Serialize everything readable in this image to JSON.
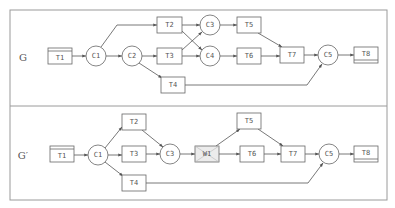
{
  "frame": {
    "left": 10,
    "top": 10,
    "right": 387,
    "divider": 106,
    "bottom": 200
  },
  "colors": {
    "frame": "#9a9a9a",
    "edge": "#555555",
    "node_stroke": "#666666",
    "node_fill": "#ffffff",
    "shaded_fill": "#ececec",
    "text": "#555555"
  },
  "graphs": [
    {
      "id": "G",
      "label": "G",
      "label_pos": [
        23,
        57
      ],
      "nodes": [
        {
          "id": "T1",
          "label": "T1",
          "type": "source",
          "x": 48,
          "y": 48,
          "w": 24,
          "h": 16
        },
        {
          "id": "C1",
          "label": "C1",
          "type": "circle",
          "cx": 96,
          "cy": 56,
          "r": 10
        },
        {
          "id": "C2",
          "label": "C2",
          "type": "circle",
          "cx": 132,
          "cy": 56,
          "r": 10
        },
        {
          "id": "T2",
          "label": "T2",
          "type": "task",
          "x": 157,
          "y": 17,
          "w": 25,
          "h": 16
        },
        {
          "id": "T3",
          "label": "T3",
          "type": "task",
          "x": 157,
          "y": 48,
          "w": 25,
          "h": 16
        },
        {
          "id": "T4",
          "label": "T4",
          "type": "task",
          "x": 161,
          "y": 77,
          "w": 24,
          "h": 16
        },
        {
          "id": "C3",
          "label": "C3",
          "type": "circle",
          "cx": 210,
          "cy": 25,
          "r": 10
        },
        {
          "id": "C4",
          "label": "C4",
          "type": "circle",
          "cx": 210,
          "cy": 56,
          "r": 10
        },
        {
          "id": "T5",
          "label": "T5",
          "type": "task",
          "x": 237,
          "y": 17,
          "w": 24,
          "h": 16
        },
        {
          "id": "T6",
          "label": "T6",
          "type": "task",
          "x": 237,
          "y": 48,
          "w": 24,
          "h": 16
        },
        {
          "id": "T7",
          "label": "T7",
          "type": "task",
          "x": 280,
          "y": 47,
          "w": 24,
          "h": 16
        },
        {
          "id": "C5",
          "label": "C5",
          "type": "circle",
          "cx": 328,
          "cy": 55,
          "r": 10
        },
        {
          "id": "T8",
          "label": "T8",
          "type": "sink",
          "x": 354,
          "y": 47,
          "w": 24,
          "h": 16
        }
      ],
      "edges": [
        {
          "from": "T1",
          "to": "C1",
          "d": "M72,56 L86,56"
        },
        {
          "from": "C1",
          "to": "T2",
          "d": "M101,47 L117,25 L157,25"
        },
        {
          "from": "C1",
          "to": "C2",
          "d": "M106,56 L122,56"
        },
        {
          "from": "C2",
          "to": "T3",
          "d": "M142,56 L157,56"
        },
        {
          "from": "C2",
          "to": "T4",
          "d": "M139,63 L162,78"
        },
        {
          "from": "T2",
          "to": "C3",
          "d": "M182,25 L200,25"
        },
        {
          "from": "T2",
          "to": "C4",
          "d": "M182,31 L202,50"
        },
        {
          "from": "T3",
          "to": "C3",
          "d": "M182,50 L202,32"
        },
        {
          "from": "T3",
          "to": "C4",
          "d": "M182,56 L200,56"
        },
        {
          "from": "C3",
          "to": "T5",
          "d": "M220,25 L237,25"
        },
        {
          "from": "C4",
          "to": "T6",
          "d": "M220,56 L237,56"
        },
        {
          "from": "T5",
          "to": "T7",
          "d": "M258,33 L282,47"
        },
        {
          "from": "T6",
          "to": "T7",
          "d": "M261,56 L280,56"
        },
        {
          "from": "T7",
          "to": "C5",
          "d": "M304,55 L318,55"
        },
        {
          "from": "T4",
          "to": "C5",
          "d": "M185,85 L307,85 L322,64"
        },
        {
          "from": "C5",
          "to": "T8",
          "d": "M338,55 L354,55"
        }
      ]
    },
    {
      "id": "G_prime",
      "label": "G′",
      "label_pos": [
        23,
        155
      ],
      "nodes": [
        {
          "id": "T1",
          "label": "T1",
          "type": "source",
          "x": 50,
          "y": 146,
          "w": 24,
          "h": 16
        },
        {
          "id": "C1",
          "label": "C1",
          "type": "circle",
          "cx": 98,
          "cy": 155,
          "r": 10
        },
        {
          "id": "T2",
          "label": "T2",
          "type": "task",
          "x": 122,
          "y": 114,
          "w": 24,
          "h": 16
        },
        {
          "id": "T3",
          "label": "T3",
          "type": "task",
          "x": 122,
          "y": 146,
          "w": 24,
          "h": 16
        },
        {
          "id": "T4",
          "label": "T4",
          "type": "task",
          "x": 122,
          "y": 175,
          "w": 24,
          "h": 16
        },
        {
          "id": "C3",
          "label": "C3",
          "type": "circle",
          "cx": 170,
          "cy": 154,
          "r": 10
        },
        {
          "id": "W1",
          "label": "W1",
          "type": "shaded",
          "x": 195,
          "y": 146,
          "w": 24,
          "h": 16
        },
        {
          "id": "T5",
          "label": "T5",
          "type": "task",
          "x": 237,
          "y": 113,
          "w": 24,
          "h": 16
        },
        {
          "id": "T6",
          "label": "T6",
          "type": "task",
          "x": 240,
          "y": 146,
          "w": 24,
          "h": 16
        },
        {
          "id": "T7",
          "label": "T7",
          "type": "task",
          "x": 281,
          "y": 146,
          "w": 24,
          "h": 16
        },
        {
          "id": "C5",
          "label": "C5",
          "type": "circle",
          "cx": 329,
          "cy": 154,
          "r": 10
        },
        {
          "id": "T8",
          "label": "T8",
          "type": "sink",
          "x": 354,
          "y": 146,
          "w": 24,
          "h": 16
        }
      ],
      "edges": [
        {
          "from": "T1",
          "to": "C1",
          "d": "M74,155 L88,155"
        },
        {
          "from": "C1",
          "to": "T2",
          "d": "M105,148 L122,127"
        },
        {
          "from": "C1",
          "to": "T3",
          "d": "M108,155 L122,155"
        },
        {
          "from": "C1",
          "to": "T4",
          "d": "M105,162 L123,176"
        },
        {
          "from": "T2",
          "to": "C3",
          "d": "M142,130 L163,147"
        },
        {
          "from": "T3",
          "to": "C3",
          "d": "M146,154 L160,154"
        },
        {
          "from": "C3",
          "to": "W1",
          "d": "M180,154 L195,154"
        },
        {
          "from": "W1",
          "to": "T5",
          "d": "M216,146 L240,129"
        },
        {
          "from": "W1",
          "to": "T6",
          "d": "M219,154 L240,154"
        },
        {
          "from": "T5",
          "to": "T7",
          "d": "M258,129 L283,146"
        },
        {
          "from": "T6",
          "to": "T7",
          "d": "M264,154 L281,154"
        },
        {
          "from": "T7",
          "to": "C5",
          "d": "M305,154 L319,154"
        },
        {
          "from": "T4",
          "to": "C5",
          "d": "M146,183 L308,183 L323,163"
        },
        {
          "from": "C5",
          "to": "T8",
          "d": "M339,154 L354,154"
        }
      ]
    }
  ]
}
